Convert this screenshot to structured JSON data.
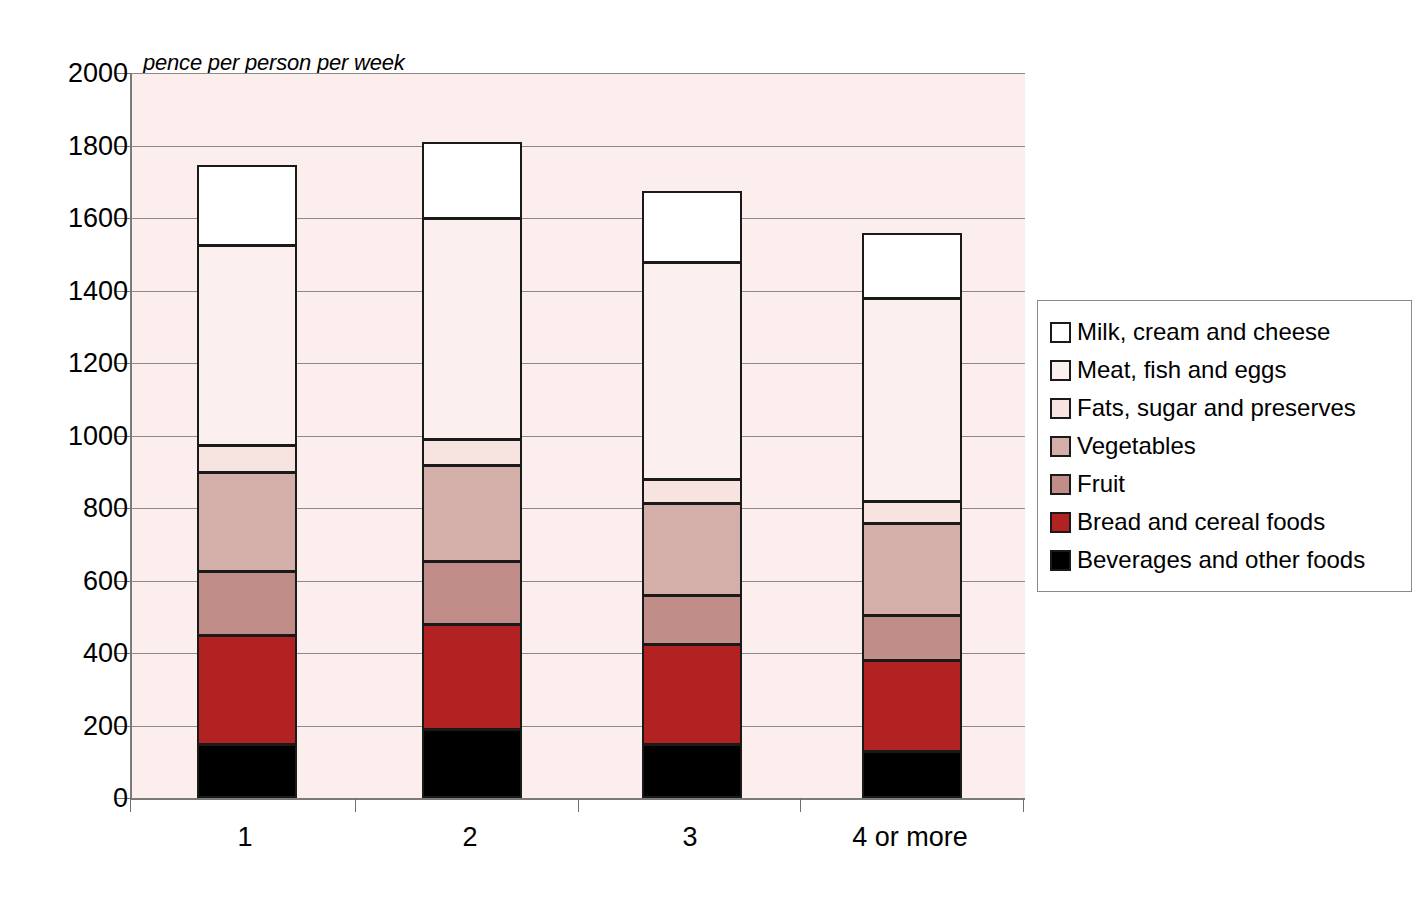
{
  "chart_data": {
    "type": "bar",
    "subtype": "stacked-bar",
    "title": "",
    "axis_note": "pence per person per week",
    "xlabel": "",
    "ylabel": "pence per person per week",
    "ylim": [
      0,
      2000
    ],
    "ytick_step": 200,
    "yticks": [
      "2000",
      "1800",
      "1600",
      "1400",
      "1200",
      "1000",
      "800",
      "600",
      "400",
      "200",
      "0"
    ],
    "ytick_values": [
      2000,
      1800,
      1600,
      1400,
      1200,
      1000,
      800,
      600,
      400,
      200,
      0
    ],
    "categories": [
      "1",
      "2",
      "3",
      "4 or more"
    ],
    "grid": true,
    "grid_axis": "y",
    "legend_position": "right",
    "stack_order_bottom_to_top": [
      "Beverages and other foods",
      "Bread and cereal foods",
      "Fruit",
      "Vegetables",
      "Fats, sugar and preserves",
      "Meat, fish and eggs",
      "Milk, cream and cheese"
    ],
    "series": [
      {
        "name": "Milk, cream and cheese",
        "color": "#ffffff",
        "values": [
          220,
          210,
          195,
          180
        ]
      },
      {
        "name": "Meat, fish and eggs",
        "color": "#fbf0ee",
        "values": [
          550,
          610,
          600,
          560
        ]
      },
      {
        "name": "Fats, sugar and preserves",
        "color": "#f7e4e1",
        "values": [
          75,
          70,
          65,
          60
        ]
      },
      {
        "name": "Vegetables",
        "color": "#d4afaa",
        "values": [
          275,
          265,
          255,
          255
        ]
      },
      {
        "name": "Fruit",
        "color": "#c08d88",
        "values": [
          175,
          175,
          135,
          125
        ]
      },
      {
        "name": "Bread and cereal foods",
        "color": "#b22222",
        "values": [
          300,
          290,
          275,
          250
        ]
      },
      {
        "name": "Beverages and other foods",
        "color": "#000000",
        "values": [
          150,
          190,
          150,
          130
        ]
      }
    ],
    "totals": [
      1745,
      1810,
      1675,
      1560
    ],
    "cumulative_tops": {
      "1": [
        150,
        450,
        625,
        900,
        975,
        1525,
        1745
      ],
      "2": [
        190,
        480,
        655,
        920,
        990,
        1600,
        1810
      ],
      "3": [
        150,
        425,
        560,
        815,
        880,
        1480,
        1675
      ],
      "4 or more": [
        130,
        380,
        505,
        760,
        820,
        1380,
        1560
      ]
    }
  },
  "legend": {
    "items": [
      {
        "label": "Milk, cream and cheese",
        "color": "#ffffff"
      },
      {
        "label": "Meat, fish and eggs",
        "color": "#fbf0ee"
      },
      {
        "label": "Fats, sugar and preserves",
        "color": "#f7e4e1"
      },
      {
        "label": "Vegetables",
        "color": "#d4afaa"
      },
      {
        "label": "Fruit",
        "color": "#c08d88"
      },
      {
        "label": "Bread and cereal foods",
        "color": "#b22222"
      },
      {
        "label": "Beverages and other foods",
        "color": "#000000"
      }
    ]
  },
  "colors": {
    "plot_background": "#fbeeed",
    "gridline": "#8a8a8a",
    "axis": "#7a7a7a",
    "bar_outline": "#1a1a1a",
    "text": "#000000",
    "legend_border": "#8a8a8a"
  }
}
